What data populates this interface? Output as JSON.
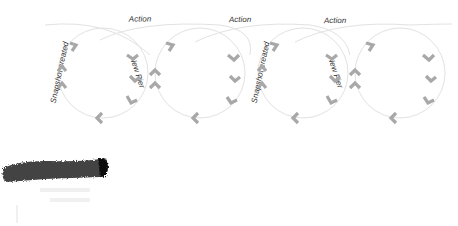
{
  "diagram": {
    "type": "cyclic-loop-flow",
    "loops": [
      {
        "id": 1,
        "top_label": "Action",
        "left_label": "Snapshot created",
        "right_label": "New Pier"
      },
      {
        "id": 2,
        "top_label": "Action",
        "left_label": "",
        "right_label": ""
      },
      {
        "id": 3,
        "top_label": "Action",
        "left_label": "Snapshot created",
        "right_label": "New Pier"
      },
      {
        "id": 4,
        "top_label": "",
        "left_label": "",
        "right_label": ""
      }
    ],
    "labels": {
      "action_1": "Action",
      "action_2": "Action",
      "action_3": "Action",
      "snapshot_1": "Snapshot created",
      "snapshot_3": "Snapshot created",
      "newpier_1": "New Pier",
      "newpier_3": "New Pier"
    },
    "colors": {
      "loop_stroke": "#e2e2e2",
      "chevron": "#a8a8a8",
      "text": "#333333",
      "brush": "#2a2a2a"
    }
  }
}
